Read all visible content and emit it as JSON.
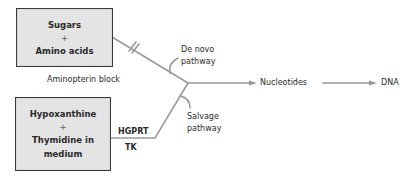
{
  "diagram": {
    "type": "flow-pathway",
    "colors": {
      "box_fill": "#e4e4e4",
      "box_border": "#3a3a3a",
      "line": "#9a9a9a",
      "text": "#2a2a2a"
    },
    "boxes": {
      "top": {
        "line1": "Sugars",
        "plus": "+",
        "line2": "Amino acids"
      },
      "bottom": {
        "line1": "Hypoxanthine",
        "plus": "+",
        "line2": "Thymidine in",
        "line3": "medium"
      }
    },
    "labels": {
      "block": "Aminopterin block",
      "de_novo_1": "De novo",
      "de_novo_2": "pathway",
      "salvage_1": "Salvage",
      "salvage_2": "pathway",
      "enzyme_top": "HGPRT",
      "enzyme_bottom": "TK",
      "product": "Nucleotides",
      "final": "DNA"
    },
    "edges": [
      {
        "from": "Sugars + Amino acids",
        "to": "junction",
        "note": "blocked (double hash)"
      },
      {
        "from": "Hypoxanthine + Thymidine in medium",
        "to": "junction",
        "via": "HGPRT / TK"
      },
      {
        "from": "junction",
        "to": "Nucleotides"
      },
      {
        "from": "Nucleotides",
        "to": "DNA"
      }
    ]
  }
}
